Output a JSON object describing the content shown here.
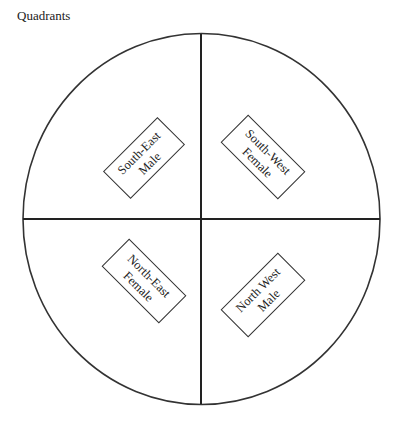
{
  "title": "Quadrants",
  "diagram": {
    "circle": {
      "cx": 201.5,
      "cy": 219,
      "rx": 178.5,
      "ry": 185.5,
      "stroke": "#333333"
    },
    "quadrants": [
      {
        "id": "top-left",
        "line1": "South-East",
        "line2": "Male",
        "cx": 144,
        "cy": 158,
        "angle": -45
      },
      {
        "id": "top-right",
        "line1": "South-West",
        "line2": "Female",
        "cx": 264,
        "cy": 158,
        "angle": 45
      },
      {
        "id": "bottom-left",
        "line1": "North-East",
        "line2": "Female",
        "cx": 144,
        "cy": 282,
        "angle": 45
      },
      {
        "id": "bottom-right",
        "line1": "North West",
        "line2": "Male",
        "cx": 264,
        "cy": 295,
        "angle": -45
      }
    ]
  }
}
